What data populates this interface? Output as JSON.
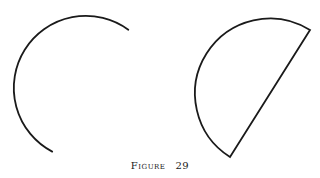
{
  "figure": {
    "caption_label": "Figure",
    "caption_number": "29",
    "shapes": [
      {
        "name": "open-circular-arc",
        "description": "circular arc open on the right (major arc)",
        "closed": false
      },
      {
        "name": "circular-segment",
        "description": "circular arc closed by a straight chord (semicircle-like region)",
        "closed": true
      }
    ]
  }
}
